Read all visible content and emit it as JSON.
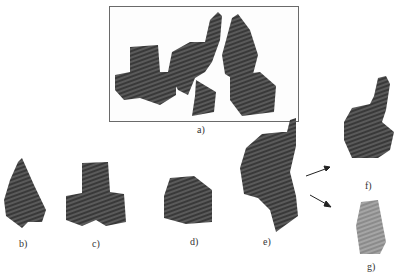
{
  "figure": {
    "panels": [
      {
        "id": "a",
        "label": "a)",
        "description": "scene with all objects"
      },
      {
        "id": "b",
        "label": "b)",
        "description": "bird-like shape"
      },
      {
        "id": "c",
        "label": "c)",
        "description": "L-shaped block cluster"
      },
      {
        "id": "d",
        "label": "d)",
        "description": "block with wedge"
      },
      {
        "id": "e",
        "label": "e)",
        "description": "merged elephant and pyramid"
      },
      {
        "id": "f",
        "label": "f)",
        "description": "elephant segment"
      },
      {
        "id": "g",
        "label": "g)",
        "description": "pyramid segment"
      }
    ],
    "colors": {
      "object_fill": "#4a4a4a",
      "object_light": "#8a8a8a",
      "segment_light": "#9a9a9a",
      "frame": "#6a6a6a"
    }
  }
}
